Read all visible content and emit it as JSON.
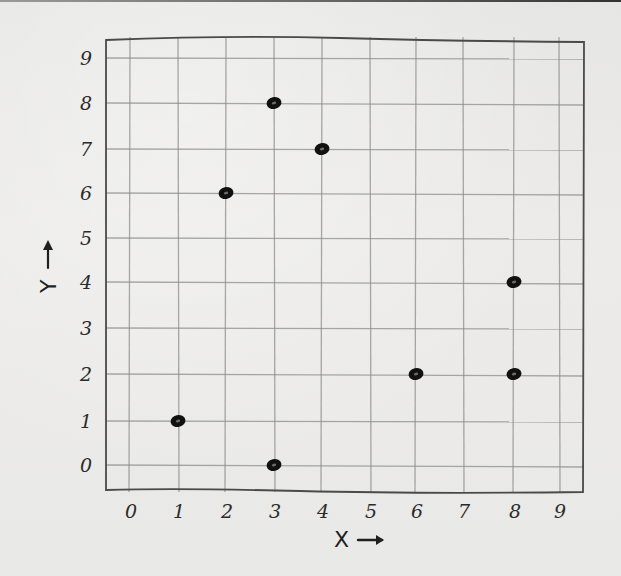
{
  "chart_data": {
    "type": "scatter",
    "title": "",
    "xlabel": "X →",
    "ylabel": "Y →",
    "x": [
      1,
      2,
      3,
      3,
      4,
      6,
      8,
      8
    ],
    "y": [
      1,
      6,
      8,
      0,
      7,
      2,
      4,
      2
    ],
    "points": [
      {
        "x": 1,
        "y": 1
      },
      {
        "x": 2,
        "y": 6
      },
      {
        "x": 3,
        "y": 8
      },
      {
        "x": 3,
        "y": 0
      },
      {
        "x": 4,
        "y": 7
      },
      {
        "x": 6,
        "y": 2
      },
      {
        "x": 8,
        "y": 4
      },
      {
        "x": 8,
        "y": 2
      }
    ],
    "xticks": [
      "0",
      "1",
      "2",
      "3",
      "4",
      "5",
      "6",
      "7",
      "8",
      "9"
    ],
    "yticks": [
      "0",
      "1",
      "2",
      "3",
      "4",
      "5",
      "6",
      "7",
      "8",
      "9"
    ],
    "xlim": [
      -0.5,
      9.5
    ],
    "ylim": [
      -0.6,
      9.5
    ],
    "grid": true,
    "legend": null,
    "style": "hand-drawn pencil on paper",
    "colors": {
      "paper": "#ebebea",
      "grid": "#8c8c8c",
      "frame": "#4a4a4a",
      "marker": "#111111"
    }
  },
  "axes": {
    "x_title": "X",
    "x_arrow": "→",
    "y_title": "Y",
    "y_arrow": "→"
  }
}
